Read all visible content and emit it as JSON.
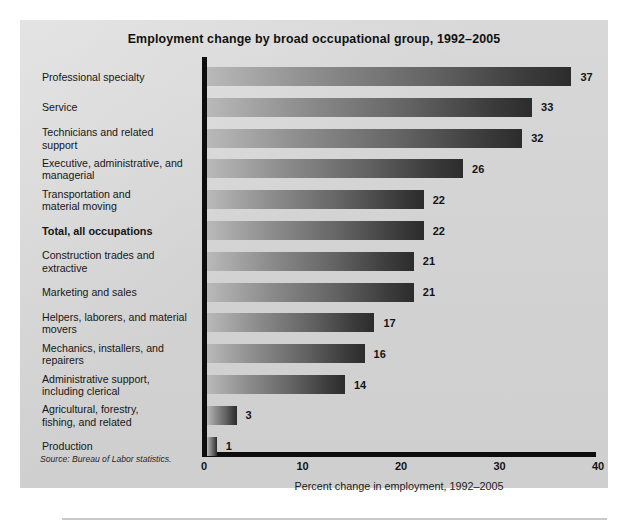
{
  "chart_data": {
    "type": "bar",
    "orientation": "horizontal",
    "title": "Employment change by broad occupational group, 1992–2005",
    "xlabel": "Percent change in employment, 1992–2005",
    "ylabel": "",
    "xlim": [
      0,
      40
    ],
    "xticks": [
      0,
      10,
      20,
      30,
      40
    ],
    "xtick_labels": [
      "0",
      "10",
      "20",
      "30",
      "40"
    ],
    "grid": false,
    "legend": null,
    "source": "Source: Bureau of Labor statistics.",
    "categories": [
      "Professional specialty",
      "Service",
      "Technicians and related support",
      "Executive, administrative, and managerial",
      "Transportation and material moving",
      "Total, all occupations",
      "Construction trades and extractive",
      "Marketing and sales",
      "Helpers, laborers, and material movers",
      "Mechanics, installers, and repairers",
      "Administrative support, including clerical",
      "Agricultural, forestry, fishing, and related",
      "Production"
    ],
    "values": [
      37,
      33,
      32,
      26,
      22,
      22,
      21,
      21,
      17,
      16,
      14,
      3,
      1
    ],
    "bars": [
      {
        "label_lines": [
          "Professional specialty"
        ],
        "value": 37,
        "value_label": "37",
        "emphasis": false
      },
      {
        "label_lines": [
          "Service"
        ],
        "value": 33,
        "value_label": "33",
        "emphasis": false
      },
      {
        "label_lines": [
          "Technicians and related",
          "support"
        ],
        "value": 32,
        "value_label": "32",
        "emphasis": false
      },
      {
        "label_lines": [
          "Executive, administrative, and",
          "managerial"
        ],
        "value": 26,
        "value_label": "26",
        "emphasis": false
      },
      {
        "label_lines": [
          "Transportation and",
          "material moving"
        ],
        "value": 22,
        "value_label": "22",
        "emphasis": false
      },
      {
        "label_lines": [
          "Total, all occupations"
        ],
        "value": 22,
        "value_label": "22",
        "emphasis": true
      },
      {
        "label_lines": [
          "Construction trades and",
          "extractive"
        ],
        "value": 21,
        "value_label": "21",
        "emphasis": false
      },
      {
        "label_lines": [
          "Marketing and sales"
        ],
        "value": 21,
        "value_label": "21",
        "emphasis": false
      },
      {
        "label_lines": [
          "Helpers, laborers, and material",
          "movers"
        ],
        "value": 17,
        "value_label": "17",
        "emphasis": false
      },
      {
        "label_lines": [
          "Mechanics, installers, and",
          "repairers"
        ],
        "value": 16,
        "value_label": "16",
        "emphasis": false
      },
      {
        "label_lines": [
          "Administrative support,",
          "including clerical"
        ],
        "value": 14,
        "value_label": "14",
        "emphasis": false
      },
      {
        "label_lines": [
          "Agricultural, forestry,",
          "fishing, and related"
        ],
        "value": 3,
        "value_label": "3",
        "emphasis": false
      },
      {
        "label_lines": [
          "Production"
        ],
        "value": 1,
        "value_label": "1",
        "emphasis": false
      }
    ]
  },
  "colors": {
    "panel_background": "#d4d4d4",
    "page_background": "#ffffff",
    "axis": "#0d0d0d",
    "bar_gradient_start": "#b9b9b9",
    "bar_gradient_end": "#2c2c2c",
    "text": "#141414"
  }
}
